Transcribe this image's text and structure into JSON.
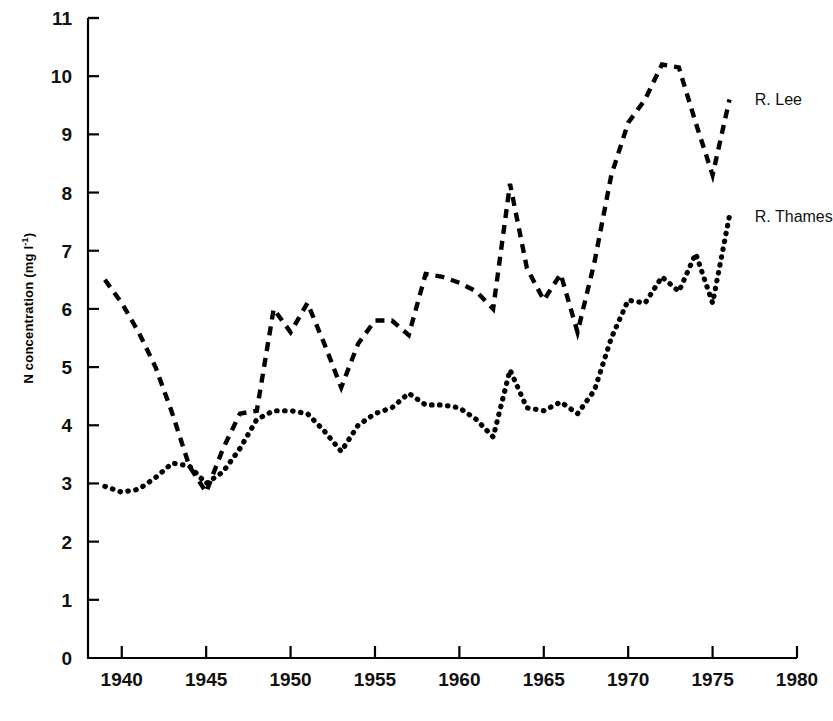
{
  "chart_data": {
    "type": "line",
    "title": "",
    "subtitle": "",
    "xlabel": "",
    "ylabel": "N concentration (mg l-1)",
    "ylabel_html": "N concentration (mg l<sup>-1</sup>)",
    "xlim": [
      1938,
      1980
    ],
    "ylim": [
      0,
      11
    ],
    "xticks": [
      1940,
      1945,
      1950,
      1955,
      1960,
      1965,
      1970,
      1975,
      1980
    ],
    "xticklabels": [
      "1940",
      "1945",
      "1950",
      "1955",
      "1960",
      "1965",
      "1970",
      "1975",
      "1980"
    ],
    "yticks": [
      0,
      1,
      2,
      3,
      4,
      5,
      6,
      7,
      8,
      9,
      10,
      11
    ],
    "yticklabels": [
      "0",
      "1",
      "2",
      "3",
      "4",
      "5",
      "6",
      "7",
      "8",
      "9",
      "10",
      "11"
    ],
    "grid": false,
    "legend_position": "right-inline-annotations",
    "axis_color": "#000000",
    "series": [
      {
        "name": "R. Lee",
        "label": "R. Lee",
        "linestyle": "dashed",
        "color": "#000000",
        "x": [
          1939,
          1940,
          1941,
          1942,
          1943,
          1944,
          1945,
          1946,
          1947,
          1948,
          1949,
          1950,
          1951,
          1952,
          1953,
          1954,
          1955,
          1956,
          1957,
          1958,
          1959,
          1960,
          1961,
          1962,
          1963,
          1964,
          1965,
          1966,
          1967,
          1968,
          1969,
          1970,
          1971,
          1972,
          1973,
          1974,
          1975,
          1976
        ],
        "values": [
          6.5,
          6.1,
          5.6,
          5.0,
          4.2,
          3.3,
          2.85,
          3.6,
          4.2,
          4.25,
          6.0,
          5.6,
          6.1,
          5.4,
          4.65,
          5.4,
          5.8,
          5.8,
          5.55,
          6.6,
          6.55,
          6.45,
          6.3,
          6.0,
          8.15,
          6.7,
          6.15,
          6.6,
          5.6,
          6.8,
          8.3,
          9.2,
          9.6,
          10.2,
          10.15,
          9.2,
          8.3,
          9.6
        ]
      },
      {
        "name": "R. Thames",
        "label": "R. Thames",
        "linestyle": "dotted",
        "color": "#000000",
        "x": [
          1939,
          1940,
          1941,
          1942,
          1943,
          1944,
          1945,
          1946,
          1947,
          1948,
          1949,
          1950,
          1951,
          1952,
          1953,
          1954,
          1955,
          1956,
          1957,
          1958,
          1959,
          1960,
          1961,
          1962,
          1963,
          1964,
          1965,
          1966,
          1967,
          1968,
          1969,
          1970,
          1971,
          1972,
          1973,
          1974,
          1975,
          1976
        ],
        "values": [
          2.95,
          2.85,
          2.9,
          3.1,
          3.35,
          3.3,
          3.0,
          3.2,
          3.6,
          4.1,
          4.25,
          4.25,
          4.2,
          3.9,
          3.55,
          4.0,
          4.2,
          4.3,
          4.55,
          4.35,
          4.35,
          4.3,
          4.1,
          3.8,
          4.95,
          4.3,
          4.25,
          4.4,
          4.2,
          4.6,
          5.5,
          6.15,
          6.1,
          6.55,
          6.3,
          6.95,
          6.1,
          7.6
        ]
      }
    ],
    "annotations": [
      {
        "text": "R. Lee",
        "x": 1977.5,
        "y": 9.6
      },
      {
        "text": "R. Thames",
        "x": 1977.5,
        "y": 7.6
      }
    ]
  }
}
